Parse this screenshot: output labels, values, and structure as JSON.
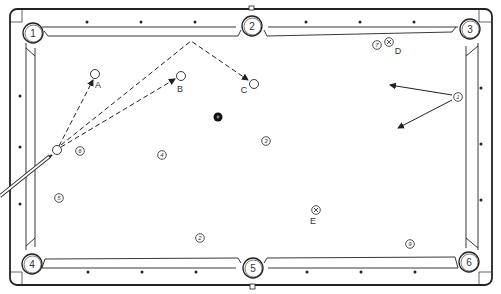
{
  "diagram": {
    "type": "pool-table-shot-diagram",
    "colors": {
      "line": "#222222",
      "background": "#ffffff",
      "eight_ball": "#111111"
    },
    "pockets": [
      {
        "label": "1",
        "x": 33,
        "y": 33
      },
      {
        "label": "2",
        "x": 252,
        "y": 26
      },
      {
        "label": "3",
        "x": 470,
        "y": 29
      },
      {
        "label": "4",
        "x": 32,
        "y": 264
      },
      {
        "label": "5",
        "x": 253,
        "y": 268
      },
      {
        "label": "6",
        "x": 469,
        "y": 262
      }
    ],
    "targets": [
      {
        "label": "A",
        "x": 95,
        "y": 74,
        "lx": 98,
        "ly": 88
      },
      {
        "label": "B",
        "x": 181,
        "y": 76,
        "lx": 180,
        "ly": 92
      },
      {
        "label": "C",
        "x": 254,
        "y": 84,
        "lx": 244,
        "ly": 93
      }
    ],
    "cue_ball": {
      "x": 57,
      "y": 150
    },
    "eight_ball": {
      "x": 218,
      "y": 117
    },
    "balls": [
      {
        "label": "1",
        "x": 458,
        "y": 97
      },
      {
        "label": "2",
        "x": 200,
        "y": 238
      },
      {
        "label": "3",
        "x": 266,
        "y": 141
      },
      {
        "label": "4",
        "x": 162,
        "y": 155
      },
      {
        "label": "5",
        "x": 59,
        "y": 198
      },
      {
        "label": "6",
        "x": 80,
        "y": 151
      },
      {
        "label": "7",
        "x": 377,
        "y": 45
      },
      {
        "label": "9",
        "x": 410,
        "y": 244
      }
    ],
    "x_marks": [
      {
        "label": "D",
        "x": 389,
        "y": 42,
        "lx": 398,
        "ly": 54
      },
      {
        "label": "E",
        "x": 316,
        "y": 210,
        "lx": 313,
        "ly": 224
      }
    ],
    "diamonds_top": [
      87,
      141,
      195,
      306,
      360,
      414
    ],
    "diamonds_bottom": [
      88,
      142,
      196,
      307,
      361,
      415
    ],
    "diamonds_left": [
      96,
      147,
      204
    ],
    "diamonds_right": [
      88,
      144,
      200
    ]
  }
}
